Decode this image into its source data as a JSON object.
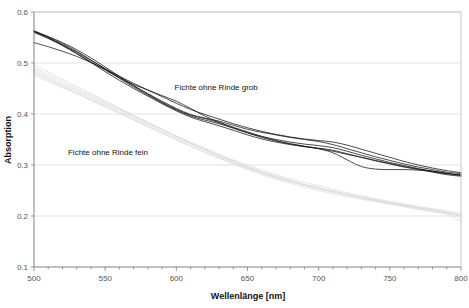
{
  "chart_data": {
    "type": "line",
    "title": "",
    "xlabel": "Wellenlänge [nm]",
    "ylabel": "Absorption",
    "xlim": [
      500,
      800
    ],
    "ylim": [
      0.1,
      0.6
    ],
    "x_ticks": [
      500,
      550,
      600,
      650,
      700,
      750,
      800
    ],
    "x_tick_labels": [
      "500",
      "550",
      "600",
      "650",
      "700",
      "750",
      "800"
    ],
    "x_minor_tick_step": 10,
    "y_ticks": [
      0.1,
      0.2,
      0.3,
      0.4,
      0.5,
      0.6
    ],
    "y_tick_labels": [
      "0.1",
      "0.2",
      "0.3",
      "0.4",
      "0.5",
      "0.6"
    ],
    "grid": "horizontal",
    "grid_color": "#dcdcdc",
    "legend_position": "none",
    "annotations": [
      {
        "text": "Fichte ohne Rinde grob",
        "x": 628,
        "y": 0.447,
        "group": "grob"
      },
      {
        "text": "Fichte ohne Rinde fein",
        "x": 552,
        "y": 0.32,
        "group": "fein"
      }
    ],
    "groups": [
      {
        "name": "Fichte ohne Rinde grob",
        "color": "#111111",
        "line_width": 0.8
      },
      {
        "name": "Fichte ohne Rinde fein",
        "color": "#d8d8d8",
        "line_width": 0.8
      }
    ],
    "x": [
      500,
      510,
      520,
      530,
      540,
      550,
      560,
      570,
      580,
      590,
      600,
      610,
      620,
      630,
      640,
      650,
      660,
      670,
      680,
      690,
      700,
      710,
      720,
      730,
      740,
      750,
      760,
      770,
      780,
      790,
      800
    ],
    "series": [
      {
        "name": "grob-1",
        "group": "grob",
        "color": "#111111",
        "values": [
          0.563,
          0.552,
          0.54,
          0.526,
          0.51,
          0.492,
          0.474,
          0.456,
          0.439,
          0.423,
          0.409,
          0.398,
          0.391,
          0.383,
          0.373,
          0.363,
          0.354,
          0.347,
          0.341,
          0.336,
          0.332,
          0.327,
          0.321,
          0.315,
          0.309,
          0.303,
          0.297,
          0.292,
          0.287,
          0.283,
          0.281
        ]
      },
      {
        "name": "grob-2",
        "group": "grob",
        "color": "#111111",
        "values": [
          0.562,
          0.551,
          0.538,
          0.523,
          0.506,
          0.488,
          0.47,
          0.453,
          0.437,
          0.422,
          0.408,
          0.396,
          0.388,
          0.381,
          0.372,
          0.363,
          0.356,
          0.35,
          0.345,
          0.341,
          0.338,
          0.334,
          0.327,
          0.319,
          0.312,
          0.305,
          0.299,
          0.293,
          0.288,
          0.283,
          0.28
        ]
      },
      {
        "name": "grob-3",
        "group": "grob",
        "color": "#111111",
        "values": [
          0.56,
          0.548,
          0.534,
          0.518,
          0.501,
          0.483,
          0.466,
          0.45,
          0.435,
          0.42,
          0.406,
          0.394,
          0.385,
          0.377,
          0.368,
          0.359,
          0.351,
          0.345,
          0.34,
          0.336,
          0.333,
          0.329,
          0.322,
          0.315,
          0.308,
          0.302,
          0.296,
          0.291,
          0.286,
          0.281,
          0.278
        ]
      },
      {
        "name": "grob-4",
        "group": "grob",
        "color": "#111111",
        "values": [
          0.54,
          0.532,
          0.523,
          0.513,
          0.501,
          0.488,
          0.474,
          0.46,
          0.447,
          0.434,
          0.421,
          0.409,
          0.399,
          0.39,
          0.381,
          0.373,
          0.366,
          0.36,
          0.355,
          0.351,
          0.348,
          0.345,
          0.339,
          0.331,
          0.323,
          0.315,
          0.307,
          0.3,
          0.294,
          0.289,
          0.285
        ]
      },
      {
        "name": "grob-5",
        "group": "grob",
        "color": "#111111",
        "values": [
          0.563,
          0.55,
          0.535,
          0.519,
          0.502,
          0.486,
          0.471,
          0.458,
          0.447,
          0.436,
          0.425,
          0.411,
          0.396,
          0.384,
          0.374,
          0.365,
          0.356,
          0.348,
          0.342,
          0.337,
          0.332,
          0.324,
          0.31,
          0.297,
          0.292,
          0.291,
          0.291,
          0.29,
          0.288,
          0.284,
          0.279
        ]
      },
      {
        "name": "grob-6",
        "group": "grob",
        "color": "#111111",
        "values": [
          0.561,
          0.549,
          0.536,
          0.521,
          0.505,
          0.489,
          0.472,
          0.455,
          0.44,
          0.425,
          0.411,
          0.399,
          0.392,
          0.386,
          0.378,
          0.37,
          0.364,
          0.359,
          0.354,
          0.35,
          0.346,
          0.34,
          0.332,
          0.324,
          0.316,
          0.309,
          0.302,
          0.296,
          0.291,
          0.286,
          0.283
        ]
      },
      {
        "name": "fein-1",
        "group": "fein",
        "color": "#dcdcdc",
        "values": [
          0.486,
          0.473,
          0.46,
          0.447,
          0.434,
          0.421,
          0.408,
          0.395,
          0.382,
          0.369,
          0.356,
          0.343,
          0.33,
          0.318,
          0.306,
          0.295,
          0.285,
          0.276,
          0.268,
          0.261,
          0.254,
          0.248,
          0.242,
          0.237,
          0.232,
          0.227,
          0.222,
          0.217,
          0.213,
          0.209,
          0.206
        ]
      },
      {
        "name": "fein-2",
        "group": "fein",
        "color": "#dcdcdc",
        "values": [
          0.48,
          0.467,
          0.454,
          0.441,
          0.428,
          0.415,
          0.402,
          0.389,
          0.376,
          0.363,
          0.35,
          0.337,
          0.325,
          0.313,
          0.302,
          0.291,
          0.281,
          0.272,
          0.264,
          0.257,
          0.25,
          0.244,
          0.238,
          0.233,
          0.228,
          0.223,
          0.218,
          0.213,
          0.208,
          0.204,
          0.2
        ]
      },
      {
        "name": "fein-3",
        "group": "fein",
        "color": "#dcdcdc",
        "values": [
          0.496,
          0.482,
          0.468,
          0.454,
          0.44,
          0.426,
          0.412,
          0.398,
          0.384,
          0.37,
          0.356,
          0.343,
          0.331,
          0.319,
          0.308,
          0.297,
          0.287,
          0.278,
          0.27,
          0.262,
          0.255,
          0.248,
          0.242,
          0.236,
          0.23,
          0.225,
          0.22,
          0.215,
          0.21,
          0.206,
          0.202
        ]
      },
      {
        "name": "fein-4",
        "group": "fein",
        "color": "#dcdcdc",
        "values": [
          0.476,
          0.464,
          0.452,
          0.44,
          0.427,
          0.414,
          0.401,
          0.388,
          0.375,
          0.362,
          0.349,
          0.337,
          0.325,
          0.314,
          0.303,
          0.293,
          0.284,
          0.275,
          0.267,
          0.26,
          0.253,
          0.247,
          0.241,
          0.235,
          0.23,
          0.225,
          0.22,
          0.215,
          0.211,
          0.207,
          0.203
        ]
      },
      {
        "name": "fein-5",
        "group": "fein",
        "color": "#dcdcdc",
        "values": [
          0.49,
          0.477,
          0.464,
          0.45,
          0.437,
          0.423,
          0.41,
          0.396,
          0.383,
          0.37,
          0.357,
          0.345,
          0.333,
          0.321,
          0.31,
          0.3,
          0.29,
          0.281,
          0.273,
          0.266,
          0.259,
          0.252,
          0.246,
          0.24,
          0.234,
          0.229,
          0.224,
          0.219,
          0.214,
          0.21,
          0.196
        ]
      },
      {
        "name": "fein-6",
        "group": "fein",
        "color": "#dcdcdc",
        "values": [
          0.483,
          0.47,
          0.457,
          0.444,
          0.431,
          0.418,
          0.405,
          0.392,
          0.379,
          0.366,
          0.353,
          0.341,
          0.329,
          0.317,
          0.306,
          0.296,
          0.286,
          0.277,
          0.269,
          0.262,
          0.255,
          0.249,
          0.243,
          0.237,
          0.231,
          0.226,
          0.221,
          0.216,
          0.211,
          0.204,
          0.19
        ]
      }
    ]
  }
}
